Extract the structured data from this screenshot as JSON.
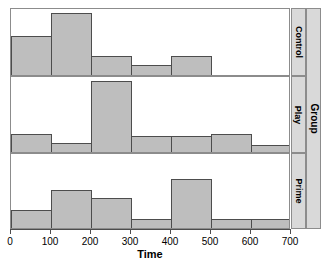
{
  "chart_data": {
    "type": "bar",
    "title": "",
    "xlabel": "Time",
    "ylabel": "",
    "outer_strip_label": "Group",
    "xlim": [
      0,
      700
    ],
    "xticks": [
      0,
      100,
      200,
      300,
      400,
      500,
      600,
      700
    ],
    "xticklabels": [
      "0",
      "100",
      "200",
      "300",
      "400",
      "500",
      "600",
      "700"
    ],
    "grid": false,
    "legend": "none",
    "bin_width": 100,
    "bin_edges": [
      0,
      100,
      200,
      300,
      400,
      500,
      600,
      700
    ],
    "colors": {
      "bar_fill": "#bebebe",
      "bar_border": "#4d4d4d",
      "panel_border": "#8c8c8c",
      "strip_background": "#d9d9d9",
      "background": "#ffffff"
    },
    "panels": [
      {
        "label": "Control",
        "ylim": [
          0,
          10
        ],
        "values": [
          6.0,
          9.6,
          3.0,
          1.6,
          3.0,
          0.0,
          0.0
        ]
      },
      {
        "label": "Play",
        "ylim": [
          0,
          10
        ],
        "values": [
          2.6,
          1.3,
          9.6,
          2.3,
          2.3,
          2.6,
          1.1
        ]
      },
      {
        "label": "Prime",
        "ylim": [
          0,
          10
        ],
        "values": [
          2.6,
          5.3,
          4.2,
          1.3,
          6.7,
          1.3,
          1.3
        ]
      }
    ],
    "series": [
      {
        "name": "Control",
        "values": [
          6.0,
          9.6,
          3.0,
          1.6,
          3.0,
          0.0,
          0.0
        ]
      },
      {
        "name": "Play",
        "values": [
          2.6,
          1.3,
          9.6,
          2.3,
          2.3,
          2.6,
          1.1
        ]
      },
      {
        "name": "Prime",
        "values": [
          2.6,
          5.3,
          4.2,
          1.3,
          6.7,
          1.3,
          1.3
        ]
      }
    ],
    "categories": [
      "0-100",
      "100-200",
      "200-300",
      "300-400",
      "400-500",
      "500-600",
      "600-700"
    ]
  }
}
